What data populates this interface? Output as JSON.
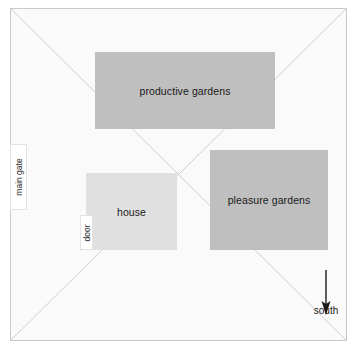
{
  "diagram": {
    "frame": {
      "name": "estate-boundary",
      "border_color": "#c9c9c9",
      "fill_color": "#fafafa"
    },
    "diagonals": {
      "name": "diagonal-guides",
      "color": "#cccccc",
      "count": 2
    },
    "plots": [
      {
        "key": "productive",
        "label": "productive gardens",
        "fill_color": "#bfbfbf",
        "x": 95,
        "y": 52,
        "width": 180,
        "height": 77
      },
      {
        "key": "pleasure",
        "label": "pleasure gardens",
        "fill_color": "#bfbfbf",
        "x": 210,
        "y": 150,
        "width": 118,
        "height": 100
      },
      {
        "key": "house",
        "label": "house",
        "fill_color": "#e0e0e0",
        "x": 86,
        "y": 173,
        "width": 91,
        "height": 77
      }
    ],
    "markers": [
      {
        "key": "main_gate",
        "label": "main gate",
        "orientation": "vertical",
        "fill_color": "#ffffff"
      },
      {
        "key": "door",
        "label": "door",
        "orientation": "vertical",
        "fill_color": "#ffffff"
      }
    ],
    "compass": {
      "icon": "down-arrow-icon",
      "direction_label": "south",
      "color": "#1a1a1a"
    }
  }
}
